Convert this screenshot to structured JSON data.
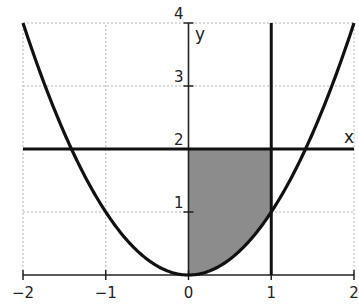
{
  "chart_data": {
    "type": "line",
    "title": "",
    "xlabel": "x",
    "ylabel": "y",
    "xlim": [
      -2,
      2
    ],
    "ylim": [
      0,
      4
    ],
    "grid": true,
    "x_ticks": [
      -2,
      -1,
      0,
      1,
      2
    ],
    "x_tick_labels": [
      "−2",
      "−1",
      "0",
      "1",
      "2"
    ],
    "y_ticks": [
      1,
      2,
      3,
      4
    ],
    "y_tick_labels": [
      "1",
      "2",
      "3",
      "4"
    ],
    "series": [
      {
        "name": "y = x^2",
        "kind": "curve",
        "x": [
          -2,
          -1.5,
          -1,
          -0.5,
          0,
          0.5,
          1,
          1.5,
          2
        ],
        "values": [
          4,
          2.25,
          1,
          0.25,
          0,
          0.25,
          1,
          2.25,
          4
        ]
      },
      {
        "name": "y = 2",
        "kind": "horizontal-line",
        "y": 2
      },
      {
        "name": "x = 1",
        "kind": "vertical-line",
        "x": 1
      }
    ],
    "shaded_region": {
      "description": "region between y = x^2 and y = 2 for 0 <= x <= 1",
      "x_range": [
        0,
        1
      ],
      "lower": "y = x^2",
      "upper": "y = 2",
      "color": "#8c8c8c"
    },
    "colors": {
      "curve": "#111111",
      "grid": "#b5b5b5",
      "axis": "#222222",
      "shade": "#8c8c8c"
    }
  }
}
